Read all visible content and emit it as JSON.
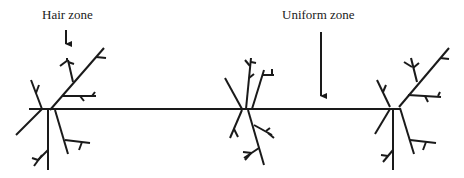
{
  "diagram": {
    "labels": {
      "hair_zone": "Hair zone",
      "uniform_zone": "Uniform zone"
    },
    "colors": {
      "stroke": "#1a1a1a",
      "background": "#ffffff"
    },
    "elements": [
      "horizontal-axis-line",
      "branch-cluster-left",
      "branch-cluster-middle",
      "branch-cluster-right",
      "hair-zone-arrow",
      "uniform-zone-arrow"
    ]
  }
}
